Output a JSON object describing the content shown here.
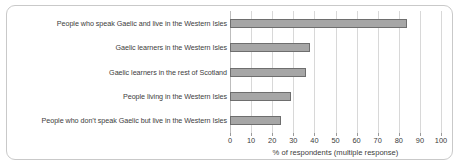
{
  "chart_data": {
    "type": "bar",
    "orientation": "horizontal",
    "title": "",
    "subtitle": "",
    "xlabel": "% of respondents (multiple response)",
    "ylabel": "",
    "xlim": [
      0,
      100
    ],
    "xticks": [
      0,
      10,
      20,
      30,
      40,
      50,
      60,
      70,
      80,
      90,
      100
    ],
    "xtick_labels": [
      "0",
      "10",
      "20",
      "30",
      "40",
      "50",
      "60",
      "70",
      "80",
      "90",
      "100"
    ],
    "grid": "vertical",
    "legend": "none",
    "categories": [
      "People who speak Gaelic and live in the Western Isles",
      "Gaelic learners in the Western Isles",
      "Gaelic learners in the rest of Scotland",
      "People living in the Western Isles",
      "People who don’t speak Gaelic but live in the Western Isles"
    ],
    "values": [
      84,
      38,
      36,
      29,
      24
    ],
    "series": [
      {
        "name": "% of respondents",
        "values": [
          84,
          38,
          36,
          29,
          24
        ]
      }
    ],
    "bar_color": "#a6a6a6",
    "bar_border_color": "#6e6e6e",
    "grid_color": "#d8d8d8",
    "text_color": "#3c3c3c",
    "border_color": "#c9c9c9"
  }
}
